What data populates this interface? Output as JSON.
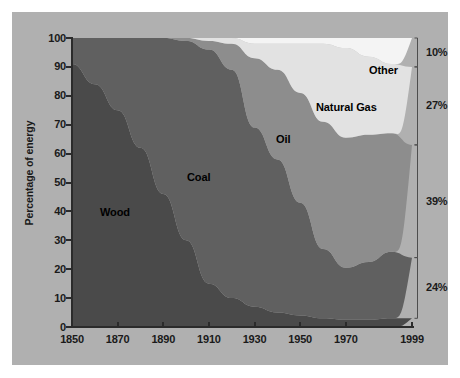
{
  "chart_data": {
    "type": "area",
    "title": "",
    "subtitle": "",
    "xlabel": "",
    "ylabel": "Percentage of energy",
    "stacked": true,
    "normalized": true,
    "grid": false,
    "legend_position": "inline-annotations",
    "xlim": [
      1850,
      1999
    ],
    "ylim": [
      0,
      100
    ],
    "x_ticks": [
      "1850",
      "1870",
      "1890",
      "1910",
      "1930",
      "1950",
      "1970",
      "1999"
    ],
    "x_tick_values": [
      1850,
      1870,
      1890,
      1910,
      1930,
      1950,
      1970,
      1999
    ],
    "y_ticks": [
      "0",
      "10",
      "20",
      "30",
      "40",
      "50",
      "60",
      "70",
      "80",
      "90",
      "100"
    ],
    "y_tick_values": [
      0,
      10,
      20,
      30,
      40,
      50,
      60,
      70,
      80,
      90,
      100
    ],
    "x": [
      1850,
      1860,
      1870,
      1880,
      1890,
      1900,
      1910,
      1920,
      1930,
      1940,
      1950,
      1960,
      1970,
      1980,
      1990,
      1999
    ],
    "series": [
      {
        "name": "Wood",
        "label": "Wood",
        "color": "#4a4a4a",
        "values": [
          91,
          84,
          75,
          62,
          46,
          30,
          15,
          10,
          7,
          5,
          4,
          3,
          2.5,
          2.5,
          3,
          3
        ]
      },
      {
        "name": "Coal",
        "label": "Coal",
        "color": "#606060",
        "values": [
          9,
          16,
          25,
          38,
          54,
          69,
          81,
          79,
          62,
          53,
          39,
          24,
          18,
          20,
          23,
          21
        ]
      },
      {
        "name": "Oil",
        "label": "Oil",
        "color": "#8d8d8d",
        "values": [
          0,
          0,
          0,
          0,
          0,
          1,
          3,
          9,
          24,
          31,
          38,
          44,
          45,
          44,
          41,
          39
        ]
      },
      {
        "name": "Natural Gas",
        "label": "Natural Gas",
        "color": "#e2e2e2",
        "values": [
          0,
          0,
          0,
          0,
          0,
          0,
          1,
          2,
          5,
          9,
          17,
          27,
          31,
          27,
          24,
          27
        ]
      },
      {
        "name": "Other",
        "label": "Other",
        "color": "#f4f4f4",
        "values": [
          0,
          0,
          0,
          0,
          0,
          0,
          0,
          0,
          2,
          2,
          2,
          2,
          3.5,
          6.5,
          9,
          10
        ]
      }
    ],
    "end_share_annotations": [
      {
        "label": "10%",
        "series": "Other",
        "value": 10
      },
      {
        "label": "27%",
        "series": "Natural Gas",
        "value": 27
      },
      {
        "label": "39%",
        "series": "Oil",
        "value": 39
      },
      {
        "label": "24%",
        "series": "Coal",
        "value": 24
      }
    ]
  },
  "figure": {
    "background_color": "#b0b0b0",
    "page_background": "#ffffff",
    "axis_color": "#2b2b2b"
  }
}
